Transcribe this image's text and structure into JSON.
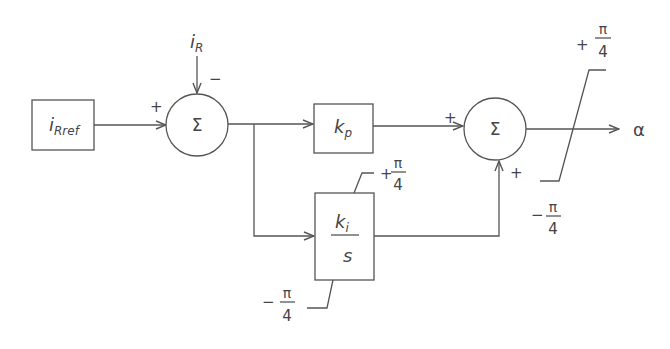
{
  "diagram": {
    "type": "block-diagram",
    "blocks": {
      "reference": {
        "main": "i",
        "sub": "Rref"
      },
      "sum1": {
        "symbol": "Σ",
        "plus_sign": "+",
        "minus_sign": "−"
      },
      "feedback": {
        "main": "i",
        "sub": "R"
      },
      "proportional": {
        "main": "k",
        "sub": "p"
      },
      "integral": {
        "num_main": "k",
        "num_sub": "i",
        "den": "s",
        "upper_limit": {
          "sign": "+",
          "num": "π",
          "den": "4"
        },
        "lower_limit": {
          "sign": "−",
          "num": "π",
          "den": "4"
        }
      },
      "sum2": {
        "symbol": "Σ",
        "plus_top": "+",
        "plus_bottom": "+"
      },
      "saturation": {
        "upper_limit": {
          "sign": "+",
          "num": "π",
          "den": "4"
        },
        "lower_limit": {
          "sign": "−",
          "num": "π",
          "den": "4"
        }
      },
      "output": {
        "label": "α"
      }
    },
    "colors": {
      "line": "#555555",
      "text": "#444444",
      "background": "#ffffff"
    }
  }
}
